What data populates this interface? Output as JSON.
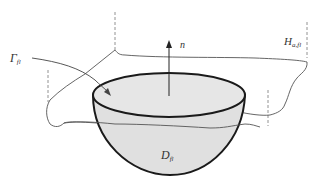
{
  "figure": {
    "type": "schematic-diagram",
    "colors": {
      "background": "#ffffff",
      "hemisphere_fill": "#e0e0e0",
      "outline": "#1a1a1a",
      "thin_lines": "#555555",
      "dashed_lines": "#777777"
    },
    "labels": {
      "gamma": {
        "main": "Γ",
        "sub": "fl"
      },
      "surface": {
        "main": "H",
        "sub": "a,fl"
      },
      "normal": {
        "main": "n⃗"
      },
      "domain": {
        "main": "D",
        "sub": "fl"
      }
    }
  }
}
